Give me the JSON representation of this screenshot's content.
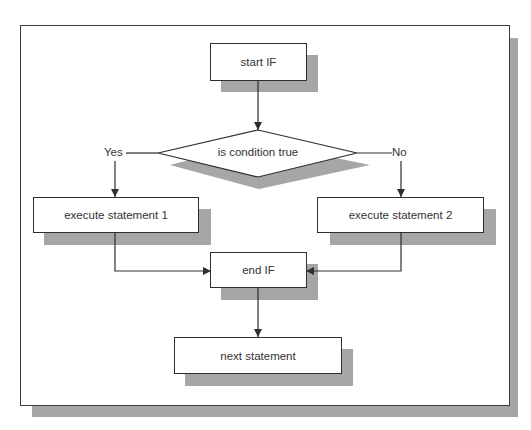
{
  "diagram": {
    "type": "flowchart",
    "nodes": {
      "start": {
        "label": "start IF",
        "shape": "rectangle"
      },
      "condition": {
        "label": "is condition true",
        "shape": "diamond"
      },
      "stmt1": {
        "label": "execute statement 1",
        "shape": "rectangle"
      },
      "stmt2": {
        "label": "execute statement 2",
        "shape": "rectangle"
      },
      "end": {
        "label": "end IF",
        "shape": "rectangle"
      },
      "next": {
        "label": "next statement",
        "shape": "rectangle"
      }
    },
    "branches": {
      "yes_label": "Yes",
      "no_label": "No"
    },
    "edges": [
      {
        "from": "start IF",
        "to": "is condition true"
      },
      {
        "from": "is condition true",
        "to": "execute statement 1",
        "label": "Yes"
      },
      {
        "from": "is condition true",
        "to": "execute statement 2",
        "label": "No"
      },
      {
        "from": "execute statement 1",
        "to": "end IF"
      },
      {
        "from": "execute statement 2",
        "to": "end IF"
      },
      {
        "from": "end IF",
        "to": "next statement"
      }
    ],
    "colors": {
      "shadow": "#a6a6a6",
      "line": "#2e2e2e",
      "text": "#333333",
      "background": "#ffffff"
    }
  }
}
